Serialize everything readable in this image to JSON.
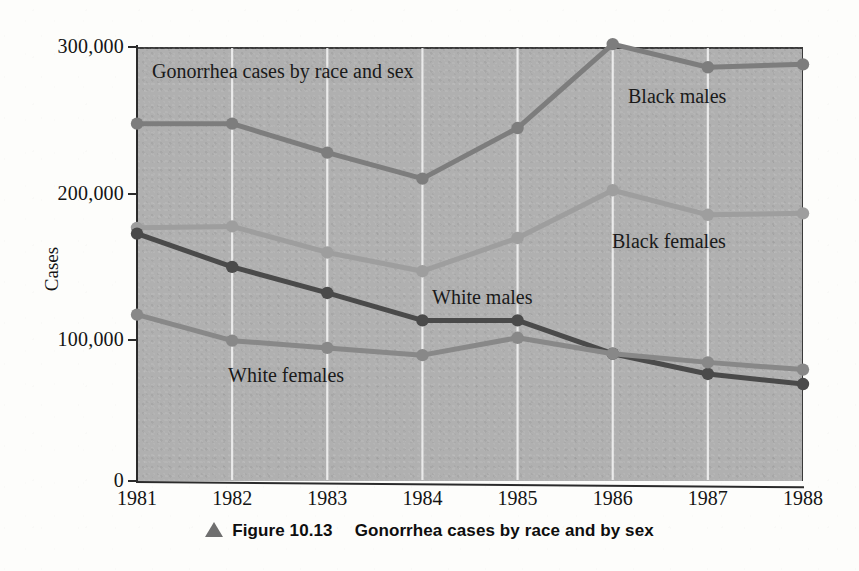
{
  "figure": {
    "caption_marker": "triangle-up-icon",
    "caption_number": "Figure 10.13",
    "caption_title": "Gonorrhea cases by race and by sex"
  },
  "chart_data": {
    "type": "line",
    "title": "Gonorrhea cases by race and sex",
    "xlabel": "",
    "ylabel": "Cases",
    "x": [
      1981,
      1982,
      1983,
      1984,
      1985,
      1986,
      1987,
      1988
    ],
    "categories": [
      "1981",
      "1982",
      "1983",
      "1984",
      "1985",
      "1986",
      "1987",
      "1988"
    ],
    "ylim": [
      0,
      300000
    ],
    "yticks": [
      0,
      100000,
      200000,
      300000
    ],
    "ytick_labels": [
      "0",
      "100,000",
      "200,000",
      "300,000"
    ],
    "grid": "vertical-only",
    "legend": "in-plot-labels",
    "series": [
      {
        "name": "Black males",
        "color": "#7d7d7d",
        "label_position": "right-upper",
        "values": [
          247000,
          247000,
          227000,
          209000,
          244000,
          302000,
          286000,
          288000
        ]
      },
      {
        "name": "Black females",
        "color": "#9e9e9e",
        "label_position": "right-middle",
        "values": [
          175000,
          176000,
          158000,
          145000,
          168000,
          201000,
          184000,
          185000
        ]
      },
      {
        "name": "White males",
        "color": "#4a4a4a",
        "label_position": "center",
        "values": [
          171000,
          148000,
          130000,
          111000,
          111000,
          88000,
          74000,
          67000
        ]
      },
      {
        "name": "White females",
        "color": "#888888",
        "label_position": "left-lower",
        "values": [
          115000,
          97000,
          92000,
          87000,
          99000,
          88000,
          82000,
          77000
        ]
      }
    ]
  },
  "plot_style": {
    "panel_background": "#b0b0b0",
    "gridline_color": "#f2f2f2",
    "axis_color": "#2b2b2b",
    "page_background": "#fdfdfb"
  }
}
